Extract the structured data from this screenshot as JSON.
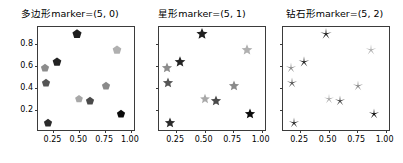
{
  "figure": {
    "width": 403,
    "height": 163,
    "background": "#ffffff",
    "axis_color": "#3b3b3b"
  },
  "chart_data": [
    {
      "type": "scatter",
      "title": "多边形marker=(5, 0)",
      "marker": "pentagon",
      "marker_spec": "(5, 0)",
      "xlabel": "",
      "ylabel": "",
      "xlim": [
        0.1,
        1.03
      ],
      "ylim": [
        0.02,
        0.95
      ],
      "grid": false,
      "legend": "none",
      "xticks": [
        0.25,
        0.5,
        0.75,
        1.0
      ],
      "xticklabels": [
        "0.25",
        "0.50",
        "0.75",
        "1.00"
      ],
      "yticks": [
        0.2,
        0.4,
        0.6,
        0.8
      ],
      "yticklabels": [
        "0.2",
        "0.4",
        "0.6",
        "0.8"
      ],
      "show_yticklabels": true,
      "x": [
        0.17,
        0.18,
        0.2,
        0.28,
        0.48,
        0.5,
        0.6,
        0.76,
        0.87,
        0.9
      ],
      "y": [
        0.58,
        0.44,
        0.08,
        0.63,
        0.89,
        0.3,
        0.28,
        0.42,
        0.74,
        0.16
      ],
      "colors": [
        "#8c8c8c",
        "#555555",
        "#2b2b2b",
        "#232323",
        "#1f1f1f",
        "#a8a8a8",
        "#4a4a4a",
        "#8a8a8a",
        "#b0b0b0",
        "#0a0a0a"
      ],
      "sizes": [
        9,
        9,
        9,
        9.5,
        10,
        8.5,
        9,
        9,
        9.5,
        9
      ]
    },
    {
      "type": "scatter",
      "title": "星形marker=(5, 1)",
      "marker": "star",
      "marker_spec": "(5, 1)",
      "xlabel": "",
      "ylabel": "",
      "xlim": [
        0.1,
        1.03
      ],
      "ylim": [
        0.02,
        0.95
      ],
      "grid": false,
      "legend": "none",
      "xticks": [
        0.25,
        0.5,
        0.75,
        1.0
      ],
      "xticklabels": [
        "0.25",
        "0.50",
        "0.75",
        "1.00"
      ],
      "yticks": [
        0.2,
        0.4,
        0.6,
        0.8
      ],
      "yticklabels": [
        "",
        "",
        "",
        ""
      ],
      "show_yticklabels": false,
      "x": [
        0.17,
        0.18,
        0.2,
        0.28,
        0.48,
        0.5,
        0.6,
        0.76,
        0.87,
        0.9
      ],
      "y": [
        0.58,
        0.44,
        0.08,
        0.63,
        0.89,
        0.3,
        0.28,
        0.42,
        0.74,
        0.16
      ],
      "colors": [
        "#8c8c8c",
        "#555555",
        "#2b2b2b",
        "#232323",
        "#1f1f1f",
        "#a8a8a8",
        "#4a4a4a",
        "#8a8a8a",
        "#b0b0b0",
        "#0a0a0a"
      ],
      "sizes": [
        11,
        11,
        11,
        11.5,
        12,
        10.5,
        11,
        11,
        11.5,
        11
      ]
    },
    {
      "type": "scatter",
      "title": "钻石形marker=(5, 2)",
      "marker": "asterisk",
      "marker_spec": "(5, 2)",
      "xlabel": "",
      "ylabel": "",
      "xlim": [
        0.1,
        1.03
      ],
      "ylim": [
        0.02,
        0.95
      ],
      "grid": false,
      "legend": "none",
      "xticks": [
        0.25,
        0.5,
        0.75,
        1.0
      ],
      "xticklabels": [
        "0.25",
        "0.50",
        "0.75",
        "1.00"
      ],
      "yticks": [
        0.2,
        0.4,
        0.6,
        0.8
      ],
      "yticklabels": [
        "",
        "",
        "",
        ""
      ],
      "show_yticklabels": false,
      "x": [
        0.17,
        0.18,
        0.2,
        0.28,
        0.48,
        0.5,
        0.6,
        0.76,
        0.87,
        0.9
      ],
      "y": [
        0.58,
        0.44,
        0.08,
        0.63,
        0.89,
        0.3,
        0.28,
        0.42,
        0.74,
        0.16
      ],
      "colors": [
        "#8c8c8c",
        "#555555",
        "#2b2b2b",
        "#232323",
        "#1f1f1f",
        "#a8a8a8",
        "#4a4a4a",
        "#8a8a8a",
        "#b0b0b0",
        "#0a0a0a"
      ],
      "sizes": [
        11,
        11,
        11,
        11.5,
        12,
        10.5,
        11,
        11,
        11.5,
        11
      ]
    }
  ],
  "layout": {
    "panels": [
      {
        "left": 2,
        "width": 136,
        "axes_left": 35,
        "axes_top": 26,
        "axes_width": 98,
        "axes_height": 105
      },
      {
        "left": 136,
        "width": 132,
        "axes_left": 22,
        "axes_top": 26,
        "axes_width": 108,
        "axes_height": 105
      },
      {
        "left": 266,
        "width": 137,
        "axes_left": 16,
        "axes_top": 26,
        "axes_width": 108,
        "axes_height": 105
      }
    ]
  }
}
